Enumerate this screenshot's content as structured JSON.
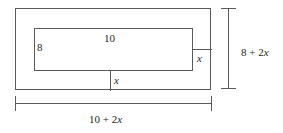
{
  "figure": {
    "stroke_color": "#58595b",
    "text_color": "#231f20",
    "background": "#ffffff"
  },
  "labels": {
    "inner_height": "8",
    "inner_width": "10",
    "border_right": "x",
    "border_bottom": "x",
    "overall_height": "8 + 2x",
    "overall_width": "10 + 2x"
  },
  "chart_data": {
    "type": "diagram",
    "title": "",
    "shapes": [
      {
        "name": "outer-rectangle",
        "kind": "rectangle",
        "x": 15,
        "y": 8,
        "width": 196,
        "height": 82,
        "label_width": "10 + 2x",
        "label_height": "8 + 2x"
      },
      {
        "name": "inner-rectangle",
        "kind": "rectangle",
        "x": 34,
        "y": 28,
        "width": 159,
        "height": 43,
        "label_width": "10",
        "label_height": "8"
      }
    ],
    "border_labels": [
      {
        "name": "right-border-width",
        "text": "x"
      },
      {
        "name": "bottom-border-width",
        "text": "x"
      }
    ],
    "dimensions": [
      {
        "name": "vertical-dimension",
        "orientation": "vertical",
        "text": "8 + 2x"
      },
      {
        "name": "horizontal-dimension",
        "orientation": "horizontal",
        "text": "10 + 2x"
      }
    ]
  }
}
